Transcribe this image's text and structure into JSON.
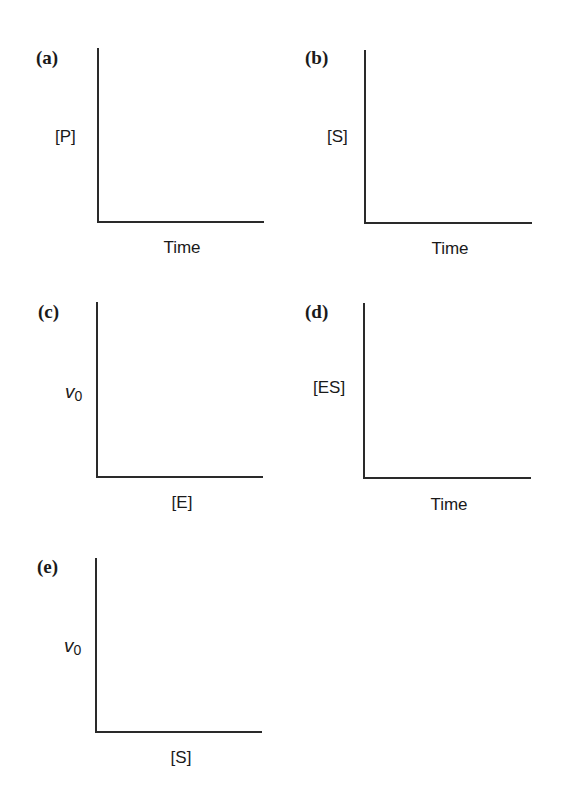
{
  "panels": [
    {
      "letter": "(a)",
      "ylabel": "[P]",
      "xlabel": "Time",
      "axes": {
        "x": 97,
        "top": 48,
        "bottom": 222,
        "right": 263
      }
    },
    {
      "letter": "(b)",
      "ylabel": "[S]",
      "xlabel": "Time",
      "axes": {
        "x": 364,
        "top": 50,
        "bottom": 223,
        "right": 532
      }
    },
    {
      "letter": "(c)",
      "ylabel_symbol": "v",
      "ylabel_sub": "0",
      "xlabel": "[E]",
      "axes": {
        "x": 96,
        "top": 302,
        "bottom": 477,
        "right": 263
      }
    },
    {
      "letter": "(d)",
      "ylabel": "[ES]",
      "xlabel": "Time",
      "axes": {
        "x": 363,
        "top": 303,
        "bottom": 478,
        "right": 531
      }
    },
    {
      "letter": "(e)",
      "ylabel_symbol": "v",
      "ylabel_sub": "0",
      "xlabel": "[S]",
      "axes": {
        "x": 95,
        "top": 558,
        "bottom": 732,
        "right": 262
      }
    }
  ],
  "colors": {
    "axis": "#2a2a2a",
    "text": "#1a1a1a",
    "background": "#ffffff"
  }
}
